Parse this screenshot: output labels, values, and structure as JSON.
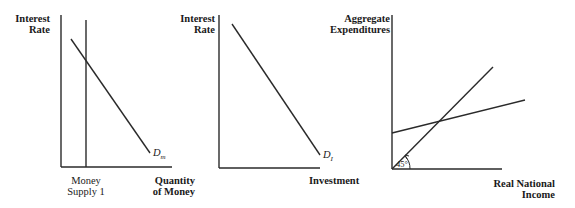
{
  "panels": [
    {
      "id": "money-market",
      "y_axis_label_line1": "Interest",
      "y_axis_label_line2": "Rate",
      "x_axis_label_line1": "Quantity",
      "x_axis_label_line2": "of Money",
      "supply_label_line1": "Money",
      "supply_label_line2": "Supply 1",
      "curve_label_main": "D",
      "curve_label_sub": "m"
    },
    {
      "id": "investment-demand",
      "y_axis_label_line1": "Interest",
      "y_axis_label_line2": "Rate",
      "x_axis_label": "Investment",
      "curve_label_main": "D",
      "curve_label_sub": "I"
    },
    {
      "id": "aggregate-expenditures",
      "y_axis_label_line1": "Aggregate",
      "y_axis_label_line2": "Expenditures",
      "x_axis_label_line1": "Real National",
      "x_axis_label_line2": "Income",
      "angle_label": "45°"
    }
  ],
  "colors": {
    "line": "#2a2a2a",
    "background": "#ffffff"
  }
}
